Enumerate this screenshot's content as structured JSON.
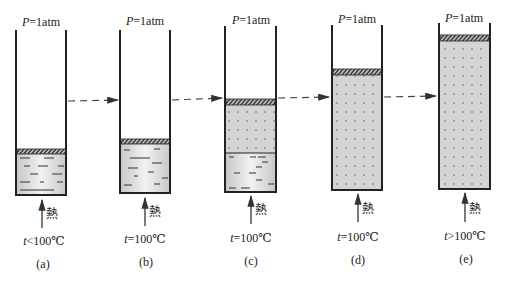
{
  "figure": {
    "pressure_label": "P=1atm",
    "pressure_var": "P",
    "pressure_value": "=1atm",
    "heat_label": "熱",
    "temp_var": "t",
    "colors": {
      "line": "#222222",
      "fill": "#d6d6d6",
      "piston_fill": "#8a8a8a",
      "dash": "#444444"
    },
    "panels": [
      {
        "id": "a",
        "caption": "(a)",
        "temp": "<100℃",
        "state": "liquid only"
      },
      {
        "id": "b",
        "caption": "(b)",
        "temp": "=100℃",
        "state": "liquid at boiling point"
      },
      {
        "id": "c",
        "caption": "(c)",
        "temp": "=100℃",
        "state": "liquid + vapor"
      },
      {
        "id": "d",
        "caption": "(d)",
        "temp": "=100℃",
        "state": "saturated vapor"
      },
      {
        "id": "e",
        "caption": "(e)",
        "temp": ">100℃",
        "state": "superheated vapor"
      }
    ]
  }
}
